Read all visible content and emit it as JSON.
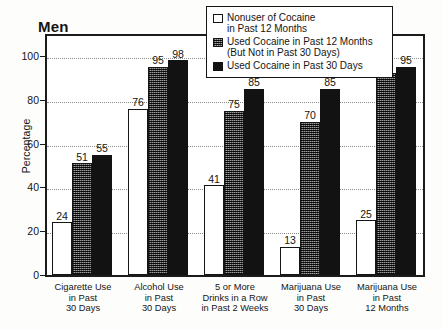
{
  "chart_data": {
    "type": "bar",
    "title": "Men",
    "xlabel": "",
    "ylabel": "Percentage",
    "ylim": [
      0,
      110
    ],
    "yticks": [
      0,
      20,
      40,
      60,
      80,
      100
    ],
    "grid": true,
    "legend_position": "top-right",
    "categories": [
      "Cigarette Use\nin Past\n30 Days",
      "Alcohol Use\nin Past\n30 Days",
      "5 or More\nDrinks in a Row\nin Past 2 Weeks",
      "Marijuana Use\nin Past\n30 Days",
      "Marijuana Use\nin Past\n12 Months"
    ],
    "series": [
      {
        "name": "Nonuser of Cocaine\nin Past 12 Months",
        "color": "#ffffff",
        "values": [
          24,
          76,
          41,
          13,
          25
        ]
      },
      {
        "name": "Used Cocaine in Past 12 Months\n(But Not in Past 30 Days)",
        "color": "#5e5e5e",
        "values": [
          51,
          95,
          75,
          70,
          92
        ]
      },
      {
        "name": "Used Cocaine in Past 30 Days",
        "color": "#121212",
        "values": [
          55,
          98,
          85,
          85,
          95
        ]
      }
    ]
  },
  "legend": {
    "items": [
      "Nonuser of Cocaine\nin Past 12 Months",
      "Used Cocaine in Past 12 Months\n(But Not in Past 30 Days)",
      "Used Cocaine in Past 30 Days"
    ]
  }
}
